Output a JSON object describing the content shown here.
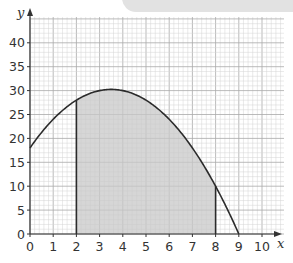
{
  "chart_data": {
    "type": "area",
    "title": "",
    "xlabel": "x",
    "ylabel": "y",
    "xlim": [
      0,
      10.5
    ],
    "ylim": [
      0,
      43
    ],
    "grid": true,
    "x_ticks": [
      "0",
      "1",
      "2",
      "3",
      "4",
      "5",
      "6",
      "7",
      "8",
      "9",
      "10"
    ],
    "y_ticks": [
      "0",
      "5",
      "10",
      "15",
      "20",
      "25",
      "30",
      "35",
      "40"
    ],
    "curve": {
      "equation": "y = 18 + 7x - x^2",
      "x": [
        0,
        1,
        2,
        3,
        3.5,
        4,
        5,
        6,
        7,
        8,
        9
      ],
      "y": [
        18,
        24,
        28,
        30,
        30.25,
        30,
        28,
        24,
        18,
        10,
        0
      ]
    },
    "shaded_region": {
      "x_from": 2,
      "x_to": 8,
      "color": "#c8c8c8"
    },
    "vertical_lines": [
      {
        "x": 2,
        "y_top": 28
      },
      {
        "x": 8,
        "y_top": 10
      }
    ],
    "colors": {
      "curve": "#2b2b2b",
      "grid_minor": "#d4d4d4",
      "grid_major": "#a9a9a9",
      "shade": "#c8c8c8"
    }
  },
  "labels": {
    "x_axis": "x",
    "y_axis": "y"
  }
}
